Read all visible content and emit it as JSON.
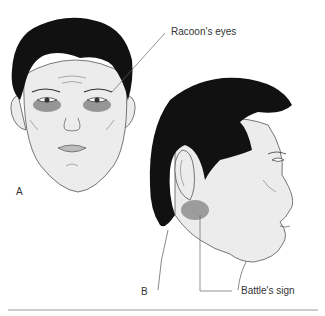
{
  "figure": {
    "panels": [
      {
        "id": "A",
        "label": "A",
        "description": "Frontal face with periorbital bruising"
      },
      {
        "id": "B",
        "label": "B",
        "description": "Side profile of head with retroauricular bruising"
      }
    ],
    "annotations": [
      {
        "text": "Racoon's eyes",
        "panel": "A"
      },
      {
        "text": "Battle's sign",
        "panel": "B"
      }
    ],
    "colors": {
      "hair": "#111111",
      "skin": "#ececec",
      "outline": "#555555",
      "bruise": "#7a7a7a",
      "leader_line": "#666666",
      "rule": "#999999"
    }
  }
}
